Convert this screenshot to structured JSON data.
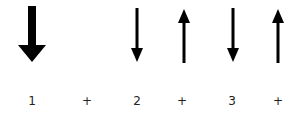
{
  "diagram": {
    "colors": {
      "arrow": "#000000",
      "text": "#222222",
      "background": "#ffffff"
    },
    "arrows": [
      {
        "id": "arrow-1",
        "direction": "down",
        "weight": "thick",
        "x": 32
      },
      {
        "id": "arrow-2",
        "direction": "down",
        "weight": "thin",
        "x": 137
      },
      {
        "id": "arrow-3",
        "direction": "up",
        "weight": "thin",
        "x": 184
      },
      {
        "id": "arrow-4",
        "direction": "down",
        "weight": "thin",
        "x": 233
      },
      {
        "id": "arrow-5",
        "direction": "up",
        "weight": "thin",
        "x": 278
      }
    ],
    "labels": [
      {
        "text": "1",
        "x": 32
      },
      {
        "text": "+",
        "x": 87
      },
      {
        "text": "2",
        "x": 137
      },
      {
        "text": "+",
        "x": 182
      },
      {
        "text": "3",
        "x": 232
      },
      {
        "text": "+",
        "x": 278
      }
    ]
  }
}
